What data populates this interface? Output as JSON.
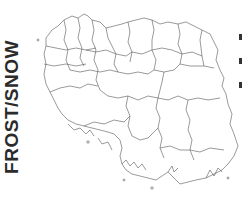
{
  "title": "FROST/SNOW",
  "map": {
    "type": "outline-map",
    "orientation": "rotated-90",
    "stroke_color": "#555555",
    "background": "#ffffff"
  },
  "legend": {
    "caption": "",
    "entries": [
      {
        "swatch_color": "#333333",
        "label": ""
      },
      {
        "swatch_color": "#333333",
        "label": ""
      },
      {
        "swatch_color": "#333333",
        "label": ""
      }
    ]
  }
}
